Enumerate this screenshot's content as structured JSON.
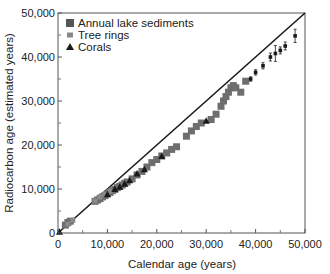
{
  "chart_data": {
    "type": "scatter",
    "title": "",
    "xlabel": "Calendar age (years)",
    "ylabel": "Radiocarbon age (estimated years)",
    "xlim": [
      0,
      50000
    ],
    "ylim": [
      0,
      50000
    ],
    "xticks": [
      0,
      10000,
      20000,
      30000,
      40000,
      50000
    ],
    "xtick_labels": [
      "0",
      "10,000",
      "20,000",
      "30,000",
      "40,000",
      "50,000"
    ],
    "yticks": [
      0,
      10000,
      20000,
      30000,
      40000,
      50000
    ],
    "ytick_labels": [
      "0",
      "10,000",
      "20,000",
      "30,000",
      "40,000",
      "50,000"
    ],
    "minor_ticks": [
      5000,
      15000,
      25000,
      35000,
      45000
    ],
    "grid": false,
    "legend_position": "upper left",
    "reference_line": {
      "label": "1:1 line",
      "from": [
        0,
        0
      ],
      "to": [
        50000,
        50000
      ]
    },
    "series": [
      {
        "name": "Annual lake sediments",
        "marker": "square",
        "color": "#6e6e6e",
        "points": [
          [
            1500,
            1800
          ],
          [
            2000,
            2400
          ],
          [
            2500,
            2700
          ],
          [
            7500,
            7200
          ],
          [
            8000,
            7500
          ],
          [
            8500,
            7800
          ],
          [
            9000,
            8200
          ],
          [
            9500,
            8500
          ],
          [
            10000,
            8900
          ],
          [
            10500,
            9200
          ],
          [
            11000,
            9600
          ],
          [
            11500,
            9900
          ],
          [
            12000,
            10300
          ],
          [
            12500,
            10600
          ],
          [
            13000,
            10900
          ],
          [
            13500,
            11300
          ],
          [
            14000,
            11600
          ],
          [
            15000,
            12300
          ],
          [
            16000,
            13200
          ],
          [
            17000,
            14000
          ],
          [
            18000,
            15000
          ],
          [
            19000,
            16000
          ],
          [
            20000,
            16700
          ],
          [
            21000,
            17500
          ],
          [
            22000,
            18200
          ],
          [
            23000,
            19000
          ],
          [
            24000,
            19600
          ],
          [
            26000,
            22000
          ],
          [
            27000,
            23200
          ],
          [
            28000,
            24200
          ],
          [
            29000,
            25000
          ],
          [
            31000,
            25800
          ],
          [
            32000,
            27000
          ],
          [
            33000,
            28800
          ],
          [
            33500,
            30000
          ],
          [
            34000,
            31000
          ],
          [
            34500,
            32000
          ],
          [
            35000,
            33000
          ],
          [
            35500,
            33500
          ],
          [
            36000,
            33000
          ],
          [
            37000,
            32000
          ],
          [
            38000,
            34500
          ]
        ]
      },
      {
        "name": "Tree rings",
        "marker": "small-square",
        "color": "#8a8a8a",
        "points": [
          [
            2000,
            2000
          ],
          [
            3000,
            2900
          ],
          [
            7500,
            7300
          ],
          [
            8500,
            8200
          ],
          [
            9500,
            8800
          ],
          [
            10500,
            9500
          ]
        ]
      },
      {
        "name": "Radiocarbon (error bars)",
        "marker": "dot-errorbar",
        "color": "#1a1a1a",
        "points": [
          [
            39000,
            35000,
            500
          ],
          [
            40000,
            36500,
            600
          ],
          [
            41500,
            38000,
            700
          ],
          [
            43000,
            40000,
            900
          ],
          [
            44000,
            40800,
            1800
          ],
          [
            45000,
            41500,
            800
          ],
          [
            46000,
            42500,
            900
          ],
          [
            48000,
            44800,
            1500
          ]
        ]
      },
      {
        "name": "Corals",
        "marker": "triangle",
        "color": "#1a1a1a",
        "points": [
          [
            300,
            300
          ],
          [
            10000,
            8800
          ],
          [
            11500,
            10000
          ],
          [
            12500,
            10500
          ],
          [
            13500,
            11200
          ],
          [
            14500,
            12000
          ],
          [
            16000,
            13500
          ],
          [
            17500,
            14500
          ],
          [
            21000,
            17500
          ],
          [
            30000,
            25500
          ]
        ]
      }
    ]
  },
  "legend": {
    "items": [
      {
        "label": "Annual lake sediments",
        "marker": "square"
      },
      {
        "label": "Tree rings",
        "marker": "small-square"
      },
      {
        "label": "Corals",
        "marker": "triangle"
      }
    ]
  },
  "axes": {
    "x_title": "Calendar age (years)",
    "y_title": "Radiocarbon age (estimated years)"
  }
}
